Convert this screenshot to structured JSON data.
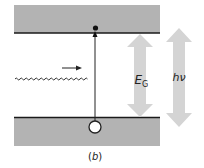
{
  "figure": {
    "caption": "(b)",
    "caption_letter": "b"
  },
  "labels": {
    "band_gap": "E",
    "band_gap_sub": "G",
    "photon_energy": "hν"
  },
  "colors": {
    "band_fill": "#b3b3b3",
    "band_edge": "#1a1a1a",
    "arrow_fill": "#d4d4d4",
    "line": "#222222",
    "background": "#ffffff"
  },
  "elements": {
    "conduction_band": "conduction band (upper gray)",
    "valence_band": "valence band (lower gray)",
    "electron": "excited electron at conduction band edge",
    "hole": "hole left in valence band",
    "photon": "incoming photon (wavy line) with direction arrow",
    "transition": "vertical excitation arrow from valence to conduction band"
  }
}
